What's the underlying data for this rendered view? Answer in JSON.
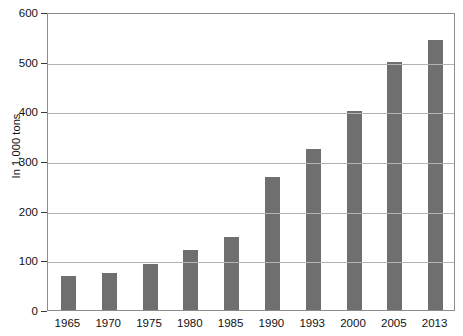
{
  "chart_data": {
    "type": "bar",
    "title": "",
    "subtitle": "",
    "xlabel": "",
    "ylabel": "In 1,000 tons",
    "categories": [
      "1965",
      "1970",
      "1975",
      "1980",
      "1985",
      "1990",
      "1993",
      "2000",
      "2005",
      "2013"
    ],
    "values": [
      68,
      74,
      92,
      120,
      148,
      268,
      325,
      400,
      500,
      543
    ],
    "ylim": [
      0,
      600
    ],
    "ytick_labels": [
      "0",
      "100",
      "200",
      "300",
      "400",
      "500",
      "600"
    ],
    "ytick_values": [
      0,
      100,
      200,
      300,
      400,
      500,
      600
    ],
    "grid": true,
    "legend": false,
    "legend_position": "none",
    "bar_color": "#6f6f6f",
    "gridline_color": "#b3b3b3",
    "frame_color": "#8c8c8c",
    "background_color": "#ffffff",
    "series": [
      {
        "name": "",
        "values": [
          68,
          74,
          92,
          120,
          148,
          268,
          325,
          400,
          500,
          543
        ]
      }
    ]
  }
}
